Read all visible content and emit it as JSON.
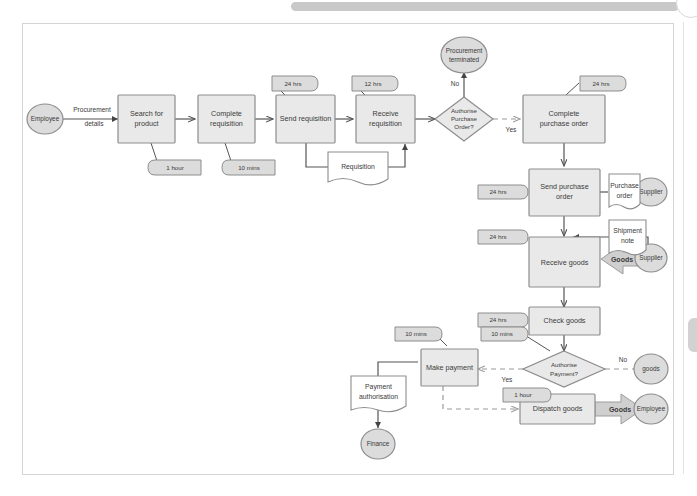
{
  "viewer": {
    "scrollbar_name": "horizontal-scrollbar",
    "corner_handle_name": "circular-handle",
    "side_tab_name": "side-tab"
  },
  "diagram": {
    "colors": {
      "node_fill": "#e9e9e9",
      "node_stroke": "#8d8d8d",
      "canvas_border": "#d5d5d5",
      "connector": "#555555",
      "dashed_connector": "#9a9a9a",
      "text": "#3a3a3a",
      "page_background": "#ffffff"
    },
    "tasks": [
      {
        "id": "search-for-product",
        "label": "Search for product"
      },
      {
        "id": "complete-requisition",
        "label": "Complete requisition"
      },
      {
        "id": "send-requisition",
        "label": "Send requisition"
      },
      {
        "id": "receive-requisition",
        "label": "Receive requisition"
      },
      {
        "id": "complete-purchase-order",
        "label": "Complete purchase order"
      },
      {
        "id": "send-purchase-order",
        "label": "Send purchase order"
      },
      {
        "id": "receive-goods",
        "label": "Receive goods"
      },
      {
        "id": "check-goods",
        "label": "Check goods"
      },
      {
        "id": "make-payment",
        "label": "Make payment"
      },
      {
        "id": "dispatch-goods",
        "label": "Dispatch goods"
      }
    ],
    "decisions": [
      {
        "id": "authorise-purchase-order",
        "line1": "Authorise",
        "line2": "Purchase",
        "line3": "Order?"
      },
      {
        "id": "authorise-payment",
        "line1": "Authorise",
        "line2": "Payment?",
        "line3": ""
      }
    ],
    "roles": [
      {
        "id": "employee-start",
        "label": "Employee"
      },
      {
        "id": "supplier-po",
        "label": "Supplier"
      },
      {
        "id": "supplier-goods",
        "label": "Supplier"
      },
      {
        "id": "employee-end",
        "label": "Employee"
      },
      {
        "id": "finance",
        "label": "Finance"
      },
      {
        "id": "procurement-terminated",
        "line1": "Procurement",
        "line2": "terminated"
      },
      {
        "id": "goods-return",
        "label": "goods"
      }
    ],
    "documents": [
      {
        "id": "requisition-doc",
        "label": "Requisition"
      },
      {
        "id": "purchase-order-doc",
        "line1": "Purchase",
        "line2": "order"
      },
      {
        "id": "shipment-note-doc",
        "line1": "Shipment",
        "line2": "note"
      },
      {
        "id": "payment-authorisation-doc",
        "line1": "Payment",
        "line2": "authorisation"
      }
    ],
    "annotations": [
      {
        "id": "ann-search-for-product",
        "label": "1 hour"
      },
      {
        "id": "ann-complete-requisition",
        "label": "10 mins"
      },
      {
        "id": "ann-send-requisition",
        "label": "24 hrs"
      },
      {
        "id": "ann-receive-requisition",
        "label": "12 hrs"
      },
      {
        "id": "ann-complete-purchase-order",
        "label": "24 hrs"
      },
      {
        "id": "ann-send-purchase-order",
        "label": "24 hrs"
      },
      {
        "id": "ann-receive-goods",
        "label": "24 hrs"
      },
      {
        "id": "ann-check-goods",
        "label": "24 hrs"
      },
      {
        "id": "ann-make-payment",
        "label": "10 mins"
      },
      {
        "id": "ann-authorise-payment",
        "label": "10 mins"
      },
      {
        "id": "ann-dispatch-goods",
        "label": "1 hour"
      }
    ],
    "edge_labels": [
      {
        "id": "edge-procurement-details",
        "line1": "Procurement",
        "line2": "details"
      },
      {
        "id": "edge-authorise-po-no",
        "label": "No"
      },
      {
        "id": "edge-authorise-po-yes",
        "label": "Yes"
      },
      {
        "id": "edge-authorise-pay-no",
        "label": "No"
      },
      {
        "id": "edge-authorise-pay-yes",
        "label": "Yes"
      },
      {
        "id": "edge-goods-inbound",
        "label": "Goods"
      },
      {
        "id": "edge-goods-outbound",
        "label": "Goods"
      }
    ]
  }
}
